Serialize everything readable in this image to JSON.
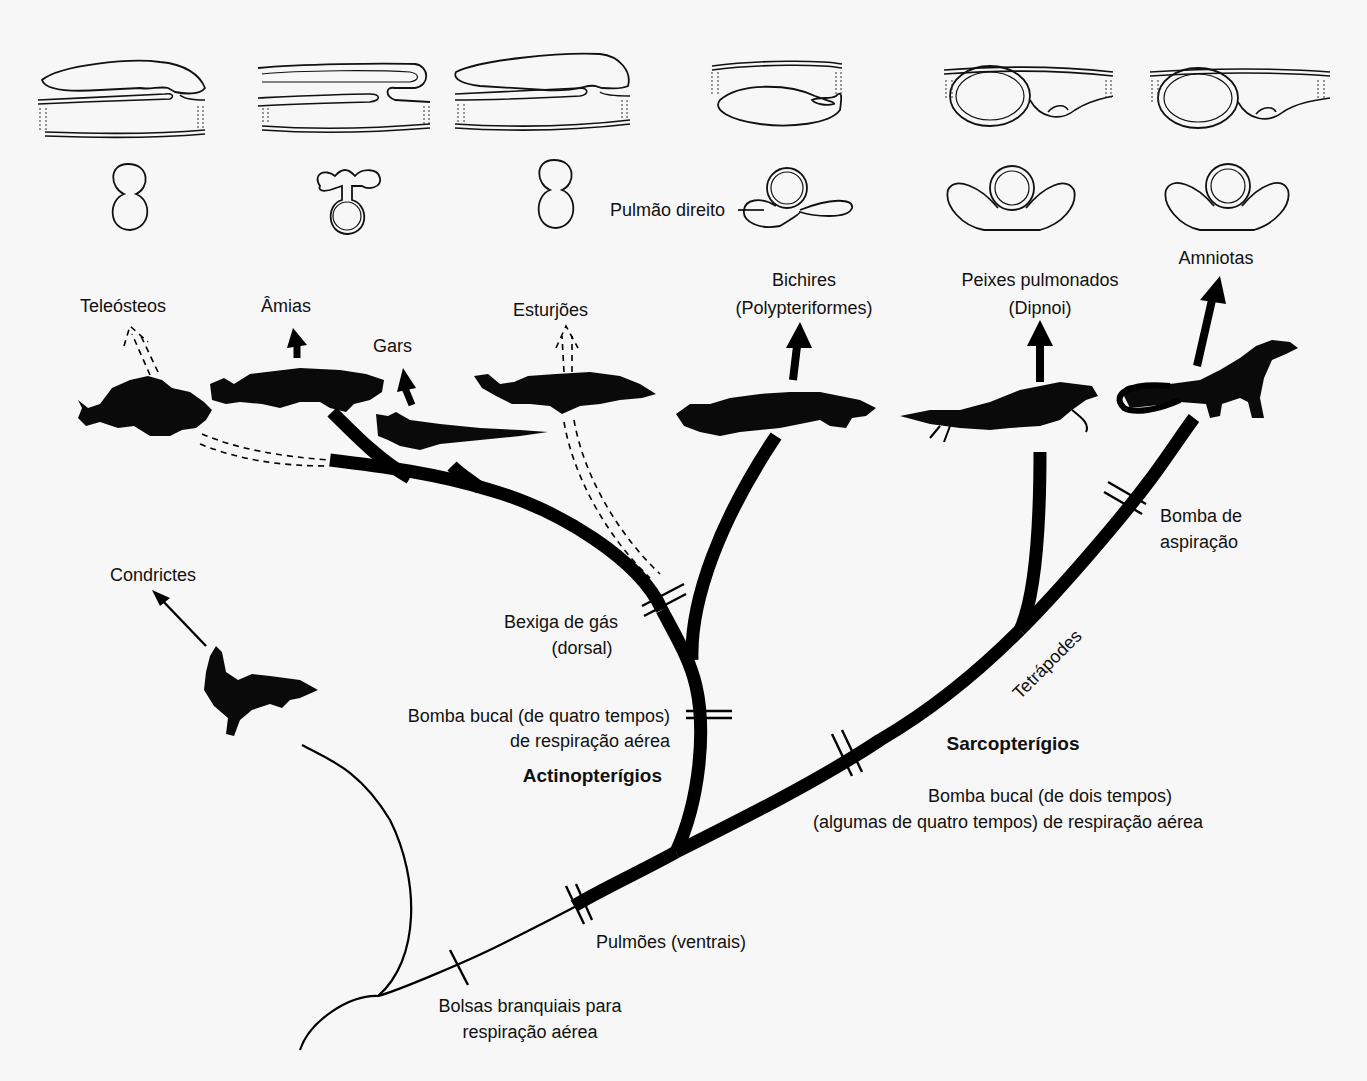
{
  "diagram": {
    "type": "phylogenetic-tree",
    "colors": {
      "background": "#f7f7f7",
      "ink": "#000000"
    }
  },
  "taxa": {
    "teleosteos": "Teleósteos",
    "amias": "Âmias",
    "gars": "Gars",
    "esturjoes": "Esturjões",
    "bichires_1": "Bichires",
    "bichires_2": "(Polypteriformes)",
    "peixes_pulmonados_1": "Peixes pulmonados",
    "peixes_pulmonados_2": "(Dipnoi)",
    "amniotas": "Amniotas",
    "condrictes": "Condrictes"
  },
  "organ_labels": {
    "pulmao_direito": "Pulmão direito"
  },
  "clades": {
    "actinopterigios": "Actinopterígios",
    "sarcopterigios": "Sarcopterígios",
    "tetrapodes": "Tetrápodes"
  },
  "characters": {
    "bexiga_1": "Bexiga de gás",
    "bexiga_2": "(dorsal)",
    "bomba_quatro_1": "Bomba bucal (de quatro tempos)",
    "bomba_quatro_2": "de respiração aérea",
    "bomba_dois_1": "Bomba bucal (de dois tempos)",
    "bomba_dois_2": "(algumas de quatro tempos) de respiração aérea",
    "aspiracao_1": "Bomba de",
    "aspiracao_2": "aspiração",
    "pulmoes": "Pulmões (ventrais)",
    "bolsas_1": "Bolsas branquiais para",
    "bolsas_2": "respiração aérea"
  }
}
